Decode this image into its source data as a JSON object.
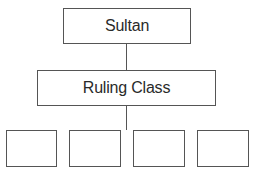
{
  "diagram": {
    "type": "hierarchy",
    "nodes": {
      "top": {
        "label": "Sultan"
      },
      "middle": {
        "label": "Ruling Class"
      },
      "bottom": [
        {
          "label": ""
        },
        {
          "label": ""
        },
        {
          "label": ""
        },
        {
          "label": ""
        }
      ]
    },
    "edges": [
      [
        "Sultan",
        "Ruling Class"
      ],
      [
        "Ruling Class",
        "bottom-row"
      ]
    ]
  }
}
